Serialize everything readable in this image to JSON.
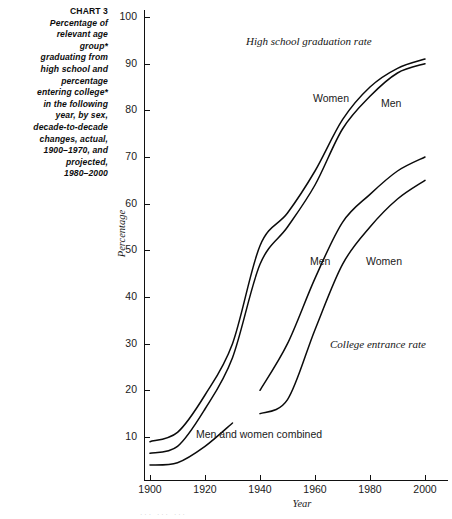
{
  "caption": {
    "chart_number": "CHART 3",
    "lines": [
      "Percentage of",
      "relevant age",
      "group*",
      "graduating from",
      "high school and",
      "percentage",
      "entering college*",
      "in the following",
      "year, by sex,",
      "decade-to-decade",
      "changes, actual,",
      "1900–1970, and",
      "projected,",
      "1980–2000"
    ]
  },
  "footnote": {
    "text": "··· ··· ···"
  },
  "colors": {
    "line": "#0b0b0b",
    "axis": "#111111",
    "text": "#1a1a1a",
    "background": "#ffffff"
  },
  "chart_data": {
    "type": "line",
    "xlabel": "Year",
    "ylabel": "Percentage",
    "xlim": [
      1895,
      2005
    ],
    "ylim": [
      0,
      104
    ],
    "xticks": [
      1900,
      1920,
      1940,
      1960,
      1980,
      2000
    ],
    "xtick_labels": [
      "1900",
      "1920",
      "1940",
      "1960",
      "1980",
      "2000"
    ],
    "yticks": [
      10,
      20,
      30,
      40,
      50,
      60,
      70,
      80,
      90,
      100
    ],
    "ytick_labels": [
      "10",
      "20",
      "30",
      "40",
      "50",
      "60",
      "70",
      "80",
      "90",
      "100"
    ],
    "grid": false,
    "legend": "inline-annotations",
    "annotations": [
      {
        "id": "hs-rate-group",
        "text": "High school graduation rate",
        "x": 1940,
        "y": 97,
        "style": "serif-italic"
      },
      {
        "id": "ce-rate-group",
        "text": "College entrance rate",
        "x": 1975,
        "y": 32,
        "style": "serif-italic"
      },
      {
        "id": "hs-women",
        "text": "Women",
        "x": 1965,
        "y": 84,
        "style": "sans"
      },
      {
        "id": "hs-men",
        "text": "Men",
        "x": 1989,
        "y": 83,
        "style": "sans"
      },
      {
        "id": "ce-men",
        "text": "Men",
        "x": 1962,
        "y": 50,
        "style": "sans"
      },
      {
        "id": "ce-women",
        "text": "Women",
        "x": 1982,
        "y": 50,
        "style": "sans"
      },
      {
        "id": "combined",
        "text": "Men and women combined",
        "x": 1918,
        "y": 12,
        "style": "sans"
      }
    ],
    "series": [
      {
        "name": "High school graduation rate - Women",
        "group": "High school graduation rate",
        "label": "Women",
        "x": [
          1900,
          1910,
          1920,
          1930,
          1940,
          1950,
          1960,
          1970,
          1980,
          1990,
          2000
        ],
        "values": [
          9,
          11,
          19,
          30,
          51,
          58,
          67,
          78,
          85,
          89,
          91
        ]
      },
      {
        "name": "High school graduation rate - Men",
        "group": "High school graduation rate",
        "label": "Men",
        "x": [
          1900,
          1910,
          1920,
          1930,
          1940,
          1950,
          1960,
          1970,
          1980,
          1990,
          2000
        ],
        "values": [
          6.5,
          8,
          16,
          27,
          47,
          55,
          64,
          76,
          83,
          88,
          90
        ]
      },
      {
        "name": "College entrance rate - Men",
        "group": "College entrance rate",
        "label": "Men",
        "x": [
          1940,
          1950,
          1960,
          1970,
          1980,
          1990,
          2000
        ],
        "values": [
          20,
          30,
          44,
          56,
          62,
          67,
          70
        ]
      },
      {
        "name": "College entrance rate - Women",
        "group": "College entrance rate",
        "label": "Women",
        "x": [
          1940,
          1950,
          1960,
          1970,
          1980,
          1990,
          2000
        ],
        "values": [
          15,
          18,
          33,
          47,
          55,
          61,
          65
        ]
      },
      {
        "name": "Men and women combined",
        "group": "Men and women combined",
        "label": "Men and women combined",
        "x": [
          1900,
          1910,
          1920,
          1930
        ],
        "values": [
          4,
          4.5,
          8,
          13
        ]
      }
    ]
  }
}
